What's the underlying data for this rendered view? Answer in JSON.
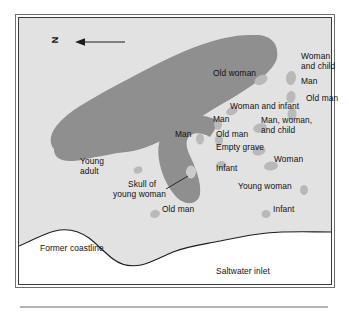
{
  "figure": {
    "type": "archaeological-site-map",
    "title": "",
    "orientation": {
      "letter": "N",
      "rotation_deg": -90,
      "arrow_direction": "left",
      "icon": "north-arrow-icon"
    },
    "colors": {
      "land_upland": "#8f8f8f",
      "land_lowland": "#e2e2e2",
      "water": "#ffffff",
      "grave": "#b9b9b9",
      "outline": "#2b2b2b",
      "text": "#111111",
      "frame_outer": "#6d6d6d",
      "frame_inner": "#3a3a3a",
      "rule": "#b4b4b4"
    },
    "regions": [
      {
        "name": "former-coastline",
        "label": "Former coastline"
      },
      {
        "name": "saltwater-inlet",
        "label": "Saltwater inlet"
      }
    ],
    "graves": [
      {
        "id": "g01",
        "label": "Old woman",
        "x": 242,
        "y": 62,
        "rx": 7,
        "ry": 4.5,
        "rot": -28
      },
      {
        "id": "g02",
        "label": "Woman and child",
        "x": 272,
        "y": 60,
        "rx": 5,
        "ry": 7,
        "rot": 8
      },
      {
        "id": "g03",
        "label": "Man",
        "x": 272,
        "y": 79,
        "rx": 4.5,
        "ry": 6,
        "rot": 10
      },
      {
        "id": "g04",
        "label": "Old man",
        "x": 273,
        "y": 96,
        "rx": 4.5,
        "ry": 6,
        "rot": 6
      },
      {
        "id": "g05",
        "label": "Woman and infant",
        "x": 213,
        "y": 93,
        "rx": 6,
        "ry": 4,
        "rot": -22
      },
      {
        "id": "g06",
        "label": "Man",
        "x": 199,
        "y": 106,
        "rx": 4,
        "ry": 6,
        "rot": 0
      },
      {
        "id": "g07",
        "label": "Man, woman, and child",
        "x": 241,
        "y": 110,
        "rx": 7,
        "ry": 4.5,
        "rot": -12
      },
      {
        "id": "g08",
        "label": "Old man",
        "x": 200,
        "y": 122,
        "rx": 4,
        "ry": 6,
        "rot": 0
      },
      {
        "id": "g09",
        "label": "Man",
        "x": 181,
        "y": 121,
        "rx": 4,
        "ry": 5.5,
        "rot": 0
      },
      {
        "id": "g10",
        "label": "Empty grave",
        "x": 240,
        "y": 133,
        "rx": 6.5,
        "ry": 4.5,
        "rot": -10
      },
      {
        "id": "g11",
        "label": "Woman",
        "x": 252,
        "y": 148,
        "rx": 7,
        "ry": 4.5,
        "rot": -8
      },
      {
        "id": "g12",
        "label": "Infant",
        "x": 202,
        "y": 147,
        "rx": 5,
        "ry": 4,
        "rot": -15
      },
      {
        "id": "g13",
        "label": "Young adult",
        "x": 119,
        "y": 152,
        "rx": 4.5,
        "ry": 3.5,
        "rot": -20
      },
      {
        "id": "g14",
        "label": "Skull of young woman",
        "x": 172,
        "y": 154,
        "rx": 5,
        "ry": 6.5,
        "rot": 0
      },
      {
        "id": "g15",
        "label": "Young woman",
        "x": 285,
        "y": 172,
        "rx": 4,
        "ry": 5,
        "rot": 0
      },
      {
        "id": "g16",
        "label": "Old man",
        "x": 136,
        "y": 196,
        "rx": 5,
        "ry": 4,
        "rot": -20
      },
      {
        "id": "g17",
        "label": "Infant",
        "x": 247,
        "y": 196,
        "rx": 4.5,
        "ry": 4,
        "rot": 0
      }
    ],
    "labels": [
      {
        "name": "label-old-woman",
        "text": "Old woman",
        "x": 195,
        "y": 57,
        "align": "left"
      },
      {
        "name": "label-woman-and-child-l1",
        "text": "Woman",
        "x": 283,
        "y": 40,
        "align": "left"
      },
      {
        "name": "label-woman-and-child-l2",
        "text": "and child",
        "x": 283,
        "y": 50,
        "align": "left"
      },
      {
        "name": "label-man-top",
        "text": "Man",
        "x": 283,
        "y": 65,
        "align": "left"
      },
      {
        "name": "label-old-man-top",
        "text": "Old man",
        "x": 288,
        "y": 82,
        "align": "left"
      },
      {
        "name": "label-woman-and-infant",
        "text": "Woman and infant",
        "x": 212,
        "y": 90,
        "align": "left"
      },
      {
        "name": "label-man-mid",
        "text": "Man",
        "x": 195,
        "y": 103,
        "align": "left"
      },
      {
        "name": "label-man-woman-child-l1",
        "text": "Man, woman,",
        "x": 243,
        "y": 104,
        "align": "left"
      },
      {
        "name": "label-man-woman-child-l2",
        "text": "and child",
        "x": 243,
        "y": 114,
        "align": "left"
      },
      {
        "name": "label-old-man-mid",
        "text": "Old man",
        "x": 198,
        "y": 118,
        "align": "left"
      },
      {
        "name": "label-man-left",
        "text": "Man",
        "x": 157,
        "y": 118,
        "align": "left"
      },
      {
        "name": "label-empty-grave",
        "text": "Empty grave",
        "x": 198,
        "y": 131,
        "align": "left"
      },
      {
        "name": "label-woman-right",
        "text": "Woman",
        "x": 256,
        "y": 143,
        "align": "left"
      },
      {
        "name": "label-young-adult-l1",
        "text": "Young",
        "x": 62,
        "y": 145,
        "align": "left"
      },
      {
        "name": "label-young-adult-l2",
        "text": "adult",
        "x": 62,
        "y": 155,
        "align": "left"
      },
      {
        "name": "label-infant-mid",
        "text": "Infant",
        "x": 198,
        "y": 152,
        "align": "left"
      },
      {
        "name": "label-skull-l1",
        "text": "Skull of",
        "x": 110,
        "y": 168,
        "align": "left"
      },
      {
        "name": "label-skull-l2",
        "text": "young woman",
        "x": 95,
        "y": 178,
        "align": "left"
      },
      {
        "name": "label-young-woman",
        "text": "Young woman",
        "x": 220,
        "y": 170,
        "align": "left"
      },
      {
        "name": "label-old-man-bottom",
        "text": "Old man",
        "x": 144,
        "y": 193,
        "align": "left"
      },
      {
        "name": "label-infant-bottom",
        "text": "Infant",
        "x": 255,
        "y": 193,
        "align": "left"
      },
      {
        "name": "label-former-coastline",
        "text": "Former coastline",
        "x": 22,
        "y": 232,
        "align": "left"
      },
      {
        "name": "label-saltwater-inlet",
        "text": "Saltwater inlet",
        "x": 198,
        "y": 255,
        "align": "left"
      }
    ]
  }
}
